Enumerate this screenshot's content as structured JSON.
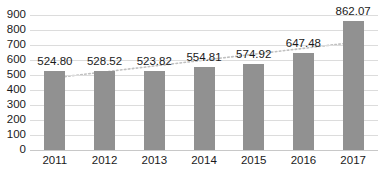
{
  "chart_data": {
    "type": "bar",
    "title": "",
    "subtitle": "",
    "xlabel": "",
    "ylabel": "",
    "categories": [
      "2011",
      "2012",
      "2013",
      "2014",
      "2015",
      "2016",
      "2017"
    ],
    "values": [
      524.8,
      528.52,
      523.82,
      554.81,
      574.92,
      647.48,
      862.07
    ],
    "data_labels": [
      "524.80",
      "528.52",
      "523.82",
      "554.81",
      "574.92",
      "647.48",
      "862.07"
    ],
    "ylim": [
      0,
      900
    ],
    "ytick_step": 100,
    "ytick_labels": [
      "900",
      "800",
      "700",
      "600",
      "500",
      "400",
      "300",
      "200",
      "100",
      "0"
    ],
    "ytick_values": [
      900,
      800,
      700,
      600,
      500,
      400,
      300,
      200,
      100,
      0
    ],
    "grid": true,
    "grid_axis": "y",
    "legend": false,
    "legend_position": "none",
    "series": [
      {
        "name": "Series 1",
        "type": "bar",
        "color": "#919191",
        "values": [
          524.8,
          528.52,
          523.82,
          554.81,
          574.92,
          647.48,
          862.07
        ]
      },
      {
        "name": "Trendline",
        "type": "line",
        "style": "dotted",
        "color": "#c0c0c0",
        "annotation": "linear trend across 2011-2017",
        "endpoints": [
          {
            "x": "2011",
            "y": 480
          },
          {
            "x": "2017",
            "y": 720
          }
        ]
      }
    ],
    "colors": {
      "bar": "#919191",
      "gridline": "#dcdcdc",
      "axis": "#c8c8c8",
      "text": "#1a1a1a",
      "trendline": "#c0c0c0",
      "background": "#ffffff"
    }
  }
}
